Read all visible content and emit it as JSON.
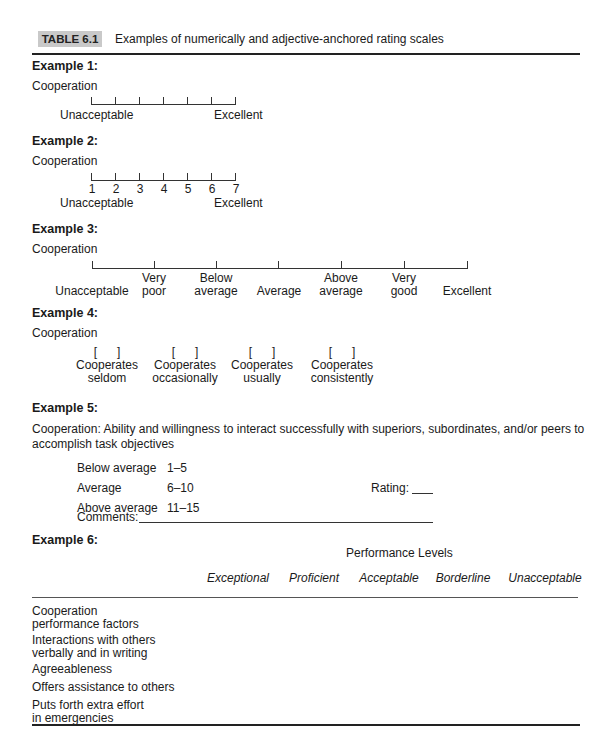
{
  "header": {
    "table_label": "TABLE 6.1",
    "caption": "Examples of numerically and adjective-anchored rating scales"
  },
  "example1": {
    "title": "Example 1:",
    "dimension": "Cooperation",
    "tick_count": 7,
    "anchor_low": "Unacceptable",
    "anchor_high": "Excellent"
  },
  "example2": {
    "title": "Example 2:",
    "dimension": "Cooperation",
    "numbers": [
      "1",
      "2",
      "3",
      "4",
      "5",
      "6",
      "7"
    ],
    "anchor_low": "Unacceptable",
    "anchor_high": "Excellent"
  },
  "example3": {
    "title": "Example 3:",
    "dimension": "Cooperation",
    "labels": [
      {
        "line1": "",
        "line2": "Unacceptable"
      },
      {
        "line1": "Very",
        "line2": "poor"
      },
      {
        "line1": "Below",
        "line2": "average"
      },
      {
        "line1": "",
        "line2": "Average"
      },
      {
        "line1": "Above",
        "line2": "average"
      },
      {
        "line1": "Very",
        "line2": "good"
      },
      {
        "line1": "",
        "line2": "Excellent"
      }
    ]
  },
  "example4": {
    "title": "Example 4:",
    "dimension": "Cooperation",
    "checkbox_glyph": "[      ]",
    "options": [
      {
        "line1": "Cooperates",
        "line2": "seldom"
      },
      {
        "line1": "Cooperates",
        "line2": "occasionally"
      },
      {
        "line1": "Cooperates",
        "line2": "usually"
      },
      {
        "line1": "Cooperates",
        "line2": "consistently"
      }
    ]
  },
  "example5": {
    "title": "Example 5:",
    "definition_line1": "Cooperation: Ability and willingness to interact successfully with superiors, subordinates, and/or peers to",
    "definition_line2": "accomplish task objectives",
    "ranges": [
      {
        "label": "Below average",
        "range": "1–5"
      },
      {
        "label": "Average",
        "range": "6–10"
      },
      {
        "label": "Above average",
        "range": "11–15"
      }
    ],
    "rating_label": "Rating:",
    "comments_label": "Comments:"
  },
  "example6": {
    "title": "Example 6:",
    "group_header": "Performance Levels",
    "columns": [
      "Exceptional",
      "Proficient",
      "Acceptable",
      "Borderline",
      "Unacceptable"
    ],
    "rows": [
      {
        "line1": "Cooperation",
        "line2": "performance factors"
      },
      {
        "line1": "Interactions with others",
        "line2": "verbally and in writing"
      },
      {
        "line1": "Agreeableness",
        "line2": ""
      },
      {
        "line1": "Offers assistance to others",
        "line2": ""
      },
      {
        "line1": "Puts forth extra effort",
        "line2": "in emergencies"
      }
    ]
  }
}
